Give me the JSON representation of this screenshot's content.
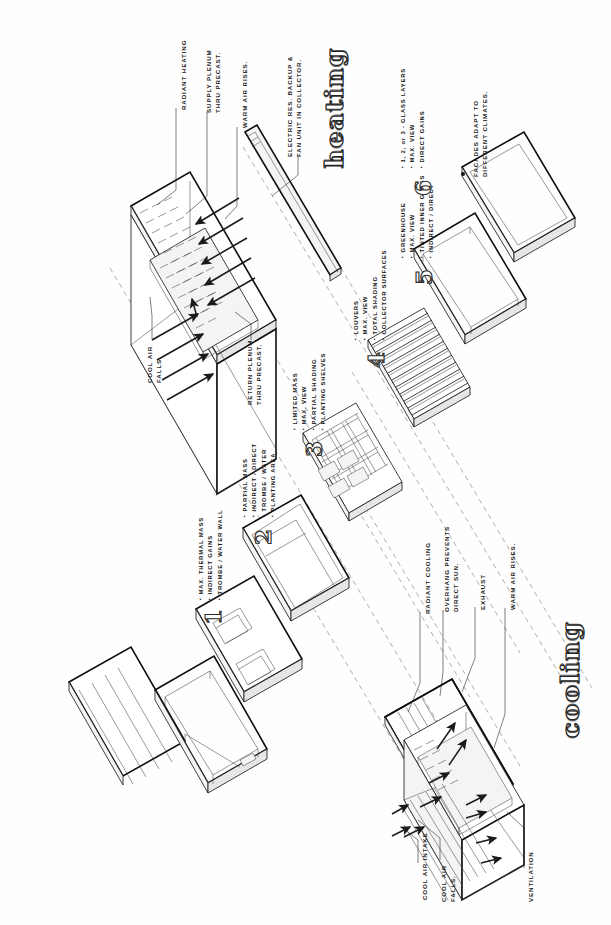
{
  "sheet": {
    "title_heating": "heating",
    "title_cooling": "cooling"
  },
  "heating": {
    "callouts": [
      {
        "name": "radiant-heating",
        "text": "RADIANT HEATING"
      },
      {
        "name": "supply-plenum",
        "text": "SUPPLY PLENUM THRU PRECAST.",
        "line1": "SUPPLY  PLENUM",
        "line2": "THRU  PRECAST."
      },
      {
        "name": "warm-air-rises",
        "text": "WARM AIR RISES."
      },
      {
        "name": "electric-backup",
        "text": "ELECTRIC RES. BACKUP & FAN UNIT IN COLLECTOR.",
        "line1": "ELECTRIC  RES.  BACKUP &",
        "line2": "FAN  UNIT  IN  COLLECTOR."
      },
      {
        "name": "cool-air-falls",
        "text": "COOL AIR FALLS.",
        "line1": "COOL  AIR",
        "line2": "FALLS."
      },
      {
        "name": "return-plenum",
        "text": "RETURN PLENUM THRU PRECAST.",
        "line1": "RETURN  PLENUM",
        "line2": "THRU  PRECAST."
      }
    ]
  },
  "cooling": {
    "callouts": [
      {
        "name": "radiant-cooling",
        "text": "RADIANT COOLING"
      },
      {
        "name": "overhang-prevents",
        "text": "OVERHANG PREVENTS DIRECT SUN.",
        "line1": "OVERHANG  PREVENTS",
        "line2": "DIRECT  SUN."
      },
      {
        "name": "exhaust",
        "text": "EXHAUST"
      },
      {
        "name": "warm-air-rises",
        "text": "WARM AIR RISES."
      },
      {
        "name": "cool-air-intake",
        "text": "COOL AIR INTAKE"
      },
      {
        "name": "cool-air-falls",
        "text": "COOL AIR FALLS.",
        "line1": "COOL  AIR",
        "line2": "FALLS."
      },
      {
        "name": "ventilation",
        "text": "VENTILATION"
      }
    ]
  },
  "facade_options": [
    {
      "number": "1",
      "bullets": [
        "MAX. THERMAL MASS",
        "INDIRECT GAINS",
        "TROMBE / WATER WALL"
      ]
    },
    {
      "number": "2",
      "bullets": [
        "PARTIAL MASS",
        "INDIRECT / DIRECT",
        "TROMBE / WATER",
        "PLANTING AREA"
      ]
    },
    {
      "number": "3",
      "bullets": [
        "LIMITED MASS",
        "MAX. VIEW",
        "PARTIAL SHADING",
        "PLANTING SHELVES"
      ]
    },
    {
      "number": "4",
      "bullets": [
        "LOUVERS",
        "MAX. VIEW",
        "TOTAL SHADING",
        "COLLECTOR SURFACES"
      ]
    },
    {
      "number": "5",
      "bullets": [
        "GREENHOUSE",
        "MAX. VIEW",
        "TINTED INNER GLASS",
        "INDIRECT / DIRECT"
      ]
    },
    {
      "number": "6",
      "bullets": [
        "1, 2, or 3 - GLASS LAYERS",
        "MAX. VIEW",
        "DIRECT GAINS"
      ]
    }
  ],
  "summary": {
    "note": "FACADES ADAPT TO DIFFERENT CLIMATES.",
    "line1": "FACADES  ADAPT  TO",
    "line2": "DIFFERENT  CLIMATES."
  },
  "colors": {
    "ink": "#1d1d1d",
    "paper": "#fefefe",
    "dashed": "#8d8d8d",
    "shade": "#e6e6e6"
  }
}
